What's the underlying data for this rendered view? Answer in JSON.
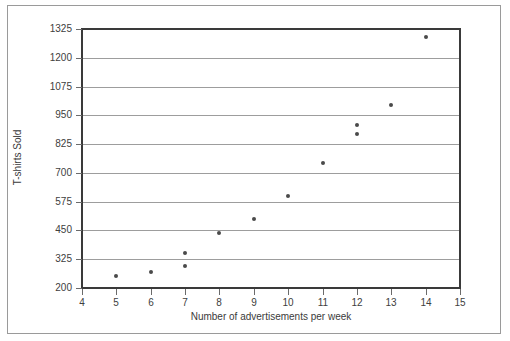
{
  "chart_data": {
    "type": "scatter",
    "title": "",
    "xlabel": "Number of advertisements per week",
    "ylabel": "T-shirts Sold",
    "xlim": [
      4,
      15
    ],
    "ylim": [
      200,
      1325
    ],
    "xticks": [
      4,
      5,
      6,
      7,
      8,
      9,
      10,
      11,
      12,
      13,
      14,
      15
    ],
    "yticks": [
      200,
      325,
      450,
      575,
      700,
      825,
      950,
      1075,
      1200,
      1325
    ],
    "xtick_labels": [
      "4",
      "5",
      "6",
      "7",
      "8",
      "9",
      "10",
      "11",
      "12",
      "13",
      "14",
      "15"
    ],
    "ytick_labels": [
      "200",
      "325",
      "450",
      "575",
      "700",
      "825",
      "950",
      "1075",
      "1200",
      "1325"
    ],
    "grid": "horizontal",
    "legend": "none",
    "marker": "filled-circle",
    "marker_color": "#4a4a4a",
    "points": [
      {
        "x": 5,
        "y": 250
      },
      {
        "x": 6,
        "y": 270
      },
      {
        "x": 7,
        "y": 295
      },
      {
        "x": 7,
        "y": 350
      },
      {
        "x": 8,
        "y": 440
      },
      {
        "x": 9,
        "y": 500
      },
      {
        "x": 10,
        "y": 600
      },
      {
        "x": 11,
        "y": 745
      },
      {
        "x": 12,
        "y": 870
      },
      {
        "x": 12,
        "y": 910
      },
      {
        "x": 13,
        "y": 995
      },
      {
        "x": 14,
        "y": 1290
      }
    ]
  }
}
